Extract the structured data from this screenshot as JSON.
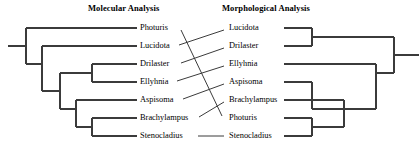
{
  "figure": {
    "kind": "cladogram-comparison",
    "panels": [
      {
        "id": "molecular",
        "title": "Molecular Analysis",
        "taxa": [
          "Photuris",
          "Lucidota",
          "Drilaster",
          "Ellyhnia",
          "Aspisoma",
          "Brachylampus",
          "Stenocladius"
        ]
      },
      {
        "id": "morphological",
        "title": "Morphological Analysis",
        "taxa": [
          "Lucidota",
          "Drilaster",
          "Ellyhnia",
          "Aspisoma",
          "Brachylampus",
          "Photuris",
          "Stenocladius"
        ]
      }
    ]
  },
  "chart_data": {
    "type": "diagram",
    "subtype": "tanglegram",
    "title": "",
    "line_color": "#3b3b3b",
    "text_color": "#000000",
    "background": "#ffffff",
    "rows": 7,
    "row_y": [
      28,
      46,
      64,
      82,
      100,
      118,
      136
    ],
    "left_tree": {
      "title": "Molecular Analysis",
      "orientation": "tips-right",
      "root_x": 8,
      "tip_x": 137,
      "leaves": [
        "Photuris",
        "Lucidota",
        "Drilaster",
        "Ellyhnia",
        "Aspisoma",
        "Brachylampus",
        "Stenocladius"
      ],
      "newick": "(Photuris,(Lucidota,((Drilaster,Ellyhnia),(Aspisoma,(Brachylampus,Stenocladius)))));",
      "nodes": [
        {
          "name": "root",
          "x": 26,
          "children_y": [
            28,
            64
          ]
        },
        {
          "name": "node-lucidota-rest",
          "x": 42,
          "children_y": [
            46,
            82
          ]
        },
        {
          "name": "node-core",
          "x": 60,
          "children_y": [
            73,
            109
          ]
        },
        {
          "name": "node-drilaster-ellyhnia",
          "x": 92,
          "children_y": [
            64,
            82
          ]
        },
        {
          "name": "node-aspisoma-clade",
          "x": 76,
          "children_y": [
            100,
            127
          ]
        },
        {
          "name": "node-brachylampus-stenocladius",
          "x": 92,
          "children_y": [
            118,
            136
          ]
        }
      ]
    },
    "right_tree": {
      "title": "Morphological Analysis",
      "orientation": "tips-left",
      "root_x": 412,
      "tip_x": 284,
      "leaves": [
        "Lucidota",
        "Drilaster",
        "Ellyhnia",
        "Aspisoma",
        "Brachylampus",
        "Photuris",
        "Stenocladius"
      ],
      "newick": "((Lucidota,Drilaster),(Ellyhnia,((Aspisoma),(Brachylampus,(Photuris,Stenocladius)))));",
      "nodes": [
        {
          "name": "root",
          "x": 394,
          "children_y": [
            37,
            73
          ]
        },
        {
          "name": "node-lucidota-drilaster",
          "x": 312,
          "children_y": [
            28,
            46
          ]
        },
        {
          "name": "node-ellyhnia-rest",
          "x": 376,
          "children_y": [
            64,
            100
          ]
        },
        {
          "name": "node-aspisoma-grade",
          "x": 312,
          "children_y": [
            82,
            109
          ]
        },
        {
          "name": "node-brachylampus-clade",
          "x": 344,
          "children_y": [
            100,
            127
          ]
        },
        {
          "name": "node-photuris-stenocladius",
          "x": 312,
          "children_y": [
            118,
            136
          ]
        }
      ]
    },
    "connectors": [
      {
        "taxon": "Lucidota",
        "from_row": 2,
        "to_row": 1,
        "kind": "diagonal"
      },
      {
        "taxon": "Drilaster",
        "from_row": 3,
        "to_row": 2,
        "kind": "diagonal"
      },
      {
        "taxon": "Ellyhnia",
        "from_row": 4,
        "to_row": 3,
        "kind": "diagonal"
      },
      {
        "taxon": "Aspisoma",
        "from_row": 5,
        "to_row": 4,
        "kind": "diagonal"
      },
      {
        "taxon": "Brachylampus",
        "from_row": 6,
        "to_row": 5,
        "kind": "diagonal"
      },
      {
        "taxon": "Photuris",
        "from_row": 1,
        "to_row": 6,
        "kind": "steep-crossing"
      },
      {
        "taxon": "Stenocladius",
        "from_row": 7,
        "to_row": 7,
        "kind": "horizontal"
      }
    ]
  }
}
